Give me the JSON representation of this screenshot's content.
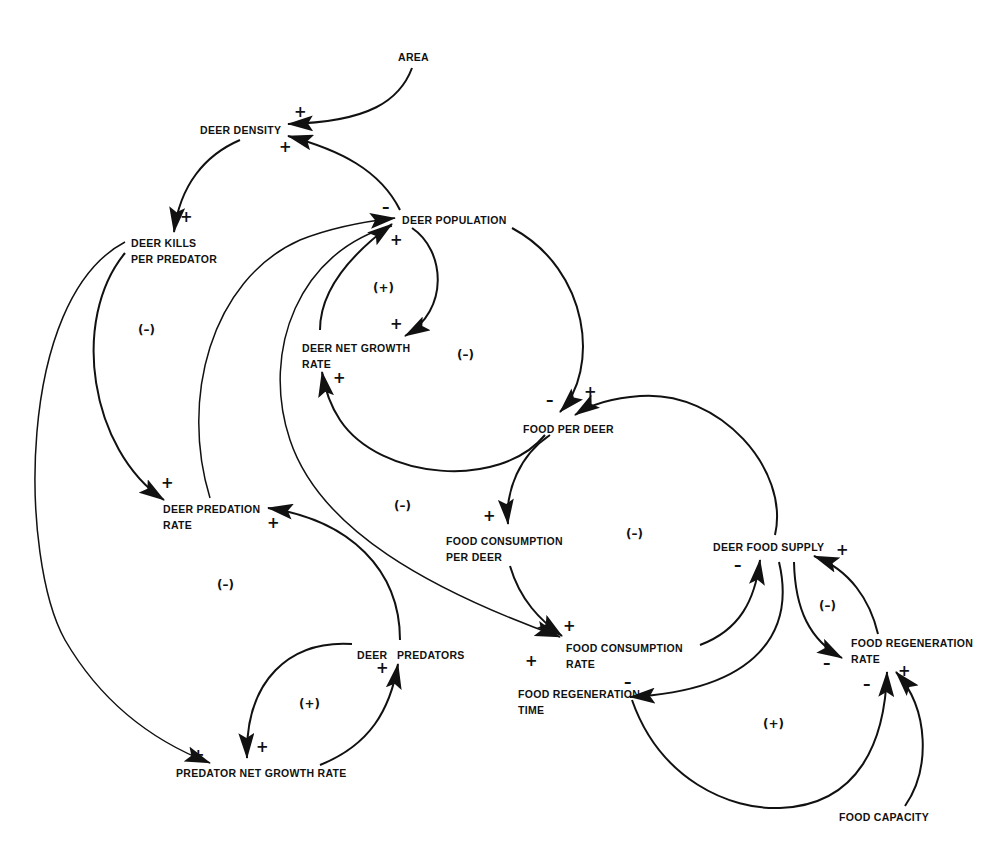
{
  "diagram": {
    "title": "",
    "type": "causal-loop-diagram",
    "nodes": {
      "area": "AREA",
      "deer_density": "DEER DENSITY",
      "deer_kills_per_predator_l1": "DEER KILLS",
      "deer_kills_per_predator_l2": "PER PREDATOR",
      "deer_population": "DEER POPULATION",
      "deer_net_growth_rate_l1": "DEER NET GROWTH",
      "deer_net_growth_rate_l2": "RATE",
      "food_per_deer": "FOOD PER DEER",
      "deer_predation_rate_l1": "DEER PREDATION",
      "deer_predation_rate_l2": "RATE",
      "food_consumption_per_deer_l1": "FOOD CONSUMPTION",
      "food_consumption_per_deer_l2": "PER DEER",
      "deer_food_supply": "DEER FOOD SUPPLY",
      "food_consumption_rate_l1": "FOOD CONSUMPTION",
      "food_consumption_rate_l2": "RATE",
      "food_regeneration_rate_l1": "FOOD REGENERATION",
      "food_regeneration_rate_l2": "RATE",
      "food_regeneration_time_l1": "FOOD REGENERATION",
      "food_regeneration_time_l2": "TIME",
      "deer_predators": "DEER   PREDATORS",
      "predator_net_growth_rate": "PREDATOR NET GROWTH RATE",
      "food_capacity": "FOOD CAPACITY"
    },
    "links": [
      {
        "from": "AREA",
        "to": "DEER DENSITY",
        "sign": "+"
      },
      {
        "from": "DEER POPULATION",
        "to": "DEER DENSITY",
        "sign": "+"
      },
      {
        "from": "DEER DENSITY",
        "to": "DEER KILLS PER PREDATOR",
        "sign": "+"
      },
      {
        "from": "DEER KILLS PER PREDATOR",
        "to": "DEER PREDATION RATE",
        "sign": "+"
      },
      {
        "from": "DEER KILLS PER PREDATOR",
        "to": "PREDATOR NET GROWTH RATE",
        "sign": "+"
      },
      {
        "from": "DEER PREDATION RATE",
        "to": "DEER POPULATION",
        "sign": "-"
      },
      {
        "from": "DEER NET GROWTH RATE",
        "to": "DEER POPULATION",
        "sign": "+"
      },
      {
        "from": "DEER POPULATION",
        "to": "DEER NET GROWTH RATE",
        "sign": "+"
      },
      {
        "from": "DEER POPULATION",
        "to": "FOOD PER DEER",
        "sign": "-"
      },
      {
        "from": "DEER POPULATION",
        "to": "FOOD CONSUMPTION RATE",
        "sign": "+"
      },
      {
        "from": "FOOD PER DEER",
        "to": "DEER NET GROWTH RATE",
        "sign": "+"
      },
      {
        "from": "FOOD PER DEER",
        "to": "FOOD CONSUMPTION PER DEER",
        "sign": "+"
      },
      {
        "from": "FOOD CONSUMPTION PER DEER",
        "to": "FOOD CONSUMPTION RATE",
        "sign": "+"
      },
      {
        "from": "FOOD CONSUMPTION RATE",
        "to": "DEER FOOD SUPPLY",
        "sign": "-"
      },
      {
        "from": "DEER FOOD SUPPLY",
        "to": "FOOD PER DEER",
        "sign": "+"
      },
      {
        "from": "DEER FOOD SUPPLY",
        "to": "FOOD REGENERATION TIME",
        "sign": "-"
      },
      {
        "from": "DEER FOOD SUPPLY",
        "to": "FOOD REGENERATION RATE",
        "sign": "-"
      },
      {
        "from": "FOOD REGENERATION RATE",
        "to": "DEER FOOD SUPPLY",
        "sign": "+"
      },
      {
        "from": "FOOD REGENERATION TIME",
        "to": "FOOD REGENERATION RATE",
        "sign": "-"
      },
      {
        "from": "FOOD CAPACITY",
        "to": "FOOD REGENERATION RATE",
        "sign": "+"
      },
      {
        "from": "DEER PREDATORS",
        "to": "DEER PREDATION RATE",
        "sign": "+"
      },
      {
        "from": "DEER PREDATORS",
        "to": "PREDATOR NET GROWTH RATE",
        "sign": "+"
      },
      {
        "from": "PREDATOR NET GROWTH RATE",
        "to": "DEER PREDATORS",
        "sign": "+"
      }
    ],
    "signs": {
      "plus": "+",
      "minus": "–"
    },
    "loops": {
      "predation_upper": "(–)",
      "deer_growth": "(+)",
      "deer_food": "(–)",
      "predation_middle": "(–)",
      "food_consumption": "(–)",
      "predation_lower": "(–)",
      "predator_growth": "(+)",
      "food_regeneration": "(–)",
      "regeneration_time": "(+)"
    }
  }
}
